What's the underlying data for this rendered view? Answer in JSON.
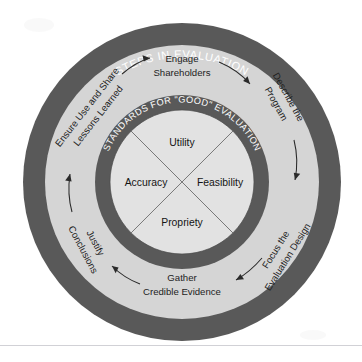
{
  "diagram": {
    "title": "STEPS IN EVALUATION",
    "outer_ring_label": "STEPS IN EVALUATION",
    "inner_ring_label": "STANDARDS FOR \"GOOD\" EVALUATION",
    "colors": {
      "dark_ring": "#595959",
      "light_ring": "#d5d5d5",
      "center": "#e2e2e2",
      "ring_text": "#ffffff",
      "body_text": "#1d1d1d",
      "background": "#ffffff"
    },
    "steps": [
      {
        "id": "engage-shareholders",
        "line1": "Engage",
        "line2": "Shareholders",
        "position": "top"
      },
      {
        "id": "describe-the-program",
        "line1": "Describe the",
        "line2": "Program",
        "position": "upper-right"
      },
      {
        "id": "focus-the-evaluation-design",
        "line1": "Focus the",
        "line2": "Evaluation Design",
        "position": "lower-right"
      },
      {
        "id": "gather-credible-evidence",
        "line1": "Gather",
        "line2": "Credible Evidence",
        "position": "bottom"
      },
      {
        "id": "justify-conclusions",
        "line1": "Justify",
        "line2": "Conclusions",
        "position": "lower-left"
      },
      {
        "id": "ensure-use-and-share-lessons-learned",
        "line1": "Ensure Use and Share",
        "line2": "Lessons Learned",
        "position": "upper-left"
      }
    ],
    "standards": [
      {
        "id": "utility",
        "label": "Utility",
        "position": "top"
      },
      {
        "id": "accuracy",
        "label": "Accuracy",
        "position": "left"
      },
      {
        "id": "feasibility",
        "label": "Feasibility",
        "position": "right"
      },
      {
        "id": "propriety",
        "label": "Propriety",
        "position": "bottom"
      }
    ]
  }
}
